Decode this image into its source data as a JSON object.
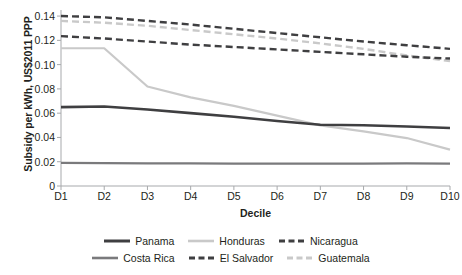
{
  "chart_data": {
    "type": "line",
    "title": "",
    "xlabel": "Decile",
    "ylabel": "Subsidy per kWh, US$2011 PPP",
    "categories": [
      "D1",
      "D2",
      "D3",
      "D4",
      "D5",
      "D6",
      "D7",
      "D8",
      "D9",
      "D10"
    ],
    "xlim": [
      0,
      9
    ],
    "ylim": [
      0,
      0.145
    ],
    "yticks": [
      "0",
      "0.02",
      "0.04",
      "0.06",
      "0.08",
      "0.10",
      "0.12",
      "0.14"
    ],
    "ytick_values": [
      0,
      0.02,
      0.04,
      0.06,
      0.08,
      0.1,
      0.12,
      0.14
    ],
    "grid": false,
    "legend_position": "bottom",
    "series": [
      {
        "name": "Panama",
        "color": "#3f3f41",
        "style": "solid",
        "width": 2.6,
        "values": [
          0.065,
          0.0655,
          0.063,
          0.06,
          0.057,
          0.0535,
          0.0505,
          0.05,
          0.049,
          0.0478
        ]
      },
      {
        "name": "Honduras",
        "color": "#c9c9c9",
        "style": "solid",
        "width": 2.2,
        "values": [
          0.1135,
          0.1135,
          0.082,
          0.073,
          0.066,
          0.058,
          0.05,
          0.045,
          0.0395,
          0.03
        ]
      },
      {
        "name": "Nicaragua",
        "color": "#3f3f41",
        "style": "dashed",
        "width": 2.4,
        "values": [
          0.14,
          0.139,
          0.136,
          0.133,
          0.1295,
          0.126,
          0.1225,
          0.119,
          0.116,
          0.113
        ]
      },
      {
        "name": "Costa Rica",
        "color": "#7a7a7c",
        "style": "solid",
        "width": 2.2,
        "values": [
          0.019,
          0.0188,
          0.0187,
          0.0186,
          0.0185,
          0.0184,
          0.0184,
          0.0185,
          0.0187,
          0.0184
        ]
      },
      {
        "name": "El Salvador",
        "color": "#3f3f41",
        "style": "dashed",
        "width": 2.4,
        "values": [
          0.1235,
          0.1215,
          0.119,
          0.1165,
          0.1145,
          0.1125,
          0.1105,
          0.1085,
          0.1065,
          0.105
        ]
      },
      {
        "name": "Guatemala",
        "color": "#c9c9c9",
        "style": "dashed",
        "width": 2.4,
        "values": [
          0.136,
          0.1345,
          0.132,
          0.1285,
          0.125,
          0.1215,
          0.1175,
          0.113,
          0.1075,
          0.103
        ]
      }
    ]
  },
  "axis": {
    "color": "#a7a9ac"
  }
}
